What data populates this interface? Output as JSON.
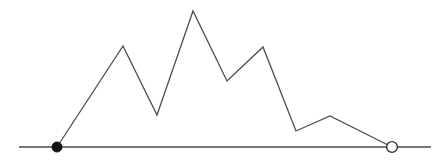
{
  "figure": {
    "name": "piecewise-linear-polyline-over-axis",
    "width": 446,
    "height": 164,
    "background_color": "#ffffff"
  },
  "axis": {
    "name": "horizontal-baseline",
    "color": "#4a4a4a",
    "stroke_width": 1.6,
    "y": 147,
    "x_start": 19,
    "x_end": 431
  },
  "polyline": {
    "color": "#4d4d4d",
    "stroke_width": 1.3,
    "fill": "none"
  },
  "endpoints": {
    "start_marker": {
      "type": "filled-circle",
      "x": 57,
      "y": 147,
      "radius": 5,
      "fill_color": "#111111",
      "stroke_color": "#111111"
    },
    "end_marker": {
      "type": "open-circle",
      "x": 392,
      "y": 147,
      "radius": 5.4,
      "fill_color": "#ffffff",
      "stroke_color": "#333333",
      "stroke_width": 1.4
    }
  },
  "chart_data": {
    "type": "line",
    "title": "",
    "subtitle": "",
    "xlabel": "",
    "ylabel": "",
    "grid": false,
    "legend": null,
    "xlim": [
      19,
      431
    ],
    "ylim": [
      147,
      11
    ],
    "axis_baseline_y": 147,
    "x": [
      57,
      123,
      157,
      193,
      227,
      263,
      296,
      330,
      392
    ],
    "y": [
      147,
      46,
      115,
      11,
      81,
      47,
      131,
      116,
      147
    ],
    "points": [
      {
        "label": "start",
        "x": 57,
        "y": 147,
        "kind": "closed-endpoint"
      },
      {
        "label": "peak-1",
        "x": 123,
        "y": 46,
        "kind": "local-maximum"
      },
      {
        "label": "valley-1",
        "x": 157,
        "y": 115,
        "kind": "local-minimum"
      },
      {
        "label": "peak-2",
        "x": 193,
        "y": 11,
        "kind": "global-maximum"
      },
      {
        "label": "valley-2",
        "x": 227,
        "y": 81,
        "kind": "local-minimum"
      },
      {
        "label": "peak-3",
        "x": 263,
        "y": 47,
        "kind": "local-maximum"
      },
      {
        "label": "valley-3",
        "x": 296,
        "y": 131,
        "kind": "local-minimum"
      },
      {
        "label": "peak-4",
        "x": 330,
        "y": 116,
        "kind": "local-maximum"
      },
      {
        "label": "end",
        "x": 392,
        "y": 147,
        "kind": "open-endpoint"
      }
    ],
    "path_points_attr": "57,147 123,46 157,115 193,11 227,81 263,47 296,131 330,116 392,147"
  }
}
